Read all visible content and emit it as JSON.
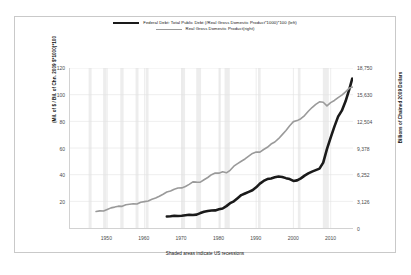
{
  "chart_data": {
    "type": "line",
    "title": "",
    "xlabel": "",
    "ylabel": "(Mil. of $ / Bil. of Chn. 2009 $*1000)*100",
    "y2label": "Billions of Chained 2009 Dollars",
    "footnote": "Shaded areas indicate US recessions",
    "grid": true,
    "legend_position": "top-center",
    "xlim": [
      1940,
      2016
    ],
    "ylim": [
      0,
      120
    ],
    "y2lim": [
      0,
      18756
    ],
    "xticks": [
      1950,
      1960,
      1970,
      1980,
      1990,
      2000,
      2010
    ],
    "xticklabels": [
      "1950",
      "1960",
      "1970",
      "1980",
      "1990",
      "2000",
      "2010"
    ],
    "yticks": [
      20,
      40,
      60,
      80,
      100,
      120
    ],
    "yticklabels": [
      "20",
      "40",
      "60",
      "80",
      "100",
      "120"
    ],
    "y2ticks": [
      0,
      3126,
      6252,
      9378,
      12504,
      15630,
      18750
    ],
    "y2ticklabels": [
      "0",
      "3,126",
      "6,252",
      "9,378",
      "12,504",
      "15,630",
      "18,750"
    ],
    "recession_bands": [
      [
        1945.0,
        1945.8
      ],
      [
        1948.9,
        1949.8
      ],
      [
        1953.5,
        1954.4
      ],
      [
        1957.6,
        1958.4
      ],
      [
        1960.3,
        1961.1
      ],
      [
        1969.9,
        1970.9
      ],
      [
        1973.9,
        1975.2
      ],
      [
        1980.0,
        1980.5
      ],
      [
        1981.5,
        1982.9
      ],
      [
        1990.5,
        1991.2
      ],
      [
        2001.2,
        2001.9
      ],
      [
        2007.9,
        2009.5
      ]
    ],
    "series": [
      {
        "name": "Federal Debt: Total Public Debt (/Real Gross Domestic Product*1000)*100 (left)",
        "axis": "left",
        "color": "#1a1a1a",
        "width": 2.6,
        "points": [
          [
            1966.0,
            8.6
          ],
          [
            1967.0,
            8.8
          ],
          [
            1968.0,
            9.2
          ],
          [
            1969.0,
            9.0
          ],
          [
            1970.0,
            9.2
          ],
          [
            1971.0,
            9.6
          ],
          [
            1972.0,
            9.9
          ],
          [
            1973.0,
            9.8
          ],
          [
            1974.0,
            10.0
          ],
          [
            1975.0,
            11.2
          ],
          [
            1976.0,
            12.2
          ],
          [
            1977.0,
            12.8
          ],
          [
            1978.0,
            13.1
          ],
          [
            1979.0,
            13.2
          ],
          [
            1980.0,
            14.0
          ],
          [
            1981.0,
            14.6
          ],
          [
            1982.0,
            16.4
          ],
          [
            1983.0,
            18.6
          ],
          [
            1984.0,
            20.0
          ],
          [
            1985.0,
            22.3
          ],
          [
            1986.0,
            24.7
          ],
          [
            1987.0,
            25.9
          ],
          [
            1988.0,
            27.1
          ],
          [
            1989.0,
            28.3
          ],
          [
            1990.0,
            30.5
          ],
          [
            1991.0,
            33.3
          ],
          [
            1992.0,
            35.3
          ],
          [
            1993.0,
            36.7
          ],
          [
            1994.0,
            37.2
          ],
          [
            1995.0,
            38.0
          ],
          [
            1996.0,
            38.6
          ],
          [
            1997.0,
            38.2
          ],
          [
            1998.0,
            37.4
          ],
          [
            1999.0,
            36.7
          ],
          [
            2000.0,
            35.3
          ],
          [
            2001.0,
            35.7
          ],
          [
            2002.0,
            37.2
          ],
          [
            2003.0,
            39.3
          ],
          [
            2004.0,
            41.0
          ],
          [
            2005.0,
            42.3
          ],
          [
            2006.0,
            43.4
          ],
          [
            2007.0,
            44.5
          ],
          [
            2008.0,
            49.0
          ],
          [
            2009.0,
            59.2
          ],
          [
            2010.0,
            67.8
          ],
          [
            2011.0,
            76.0
          ],
          [
            2012.0,
            83.5
          ],
          [
            2013.0,
            88.0
          ],
          [
            2014.0,
            95.0
          ],
          [
            2015.0,
            104.0
          ],
          [
            2015.8,
            112.0
          ],
          [
            2016.2,
            111.0
          ]
        ]
      },
      {
        "name": "Real Gross Domestic Product(right)",
        "axis": "right",
        "color": "#9a9a9a",
        "width": 1.6,
        "points": [
          [
            1947.0,
            1930
          ],
          [
            1948.0,
            2010
          ],
          [
            1949.0,
            1990
          ],
          [
            1950.0,
            2180
          ],
          [
            1951.0,
            2360
          ],
          [
            1952.0,
            2450
          ],
          [
            1953.0,
            2560
          ],
          [
            1954.0,
            2540
          ],
          [
            1955.0,
            2720
          ],
          [
            1956.0,
            2780
          ],
          [
            1957.0,
            2840
          ],
          [
            1958.0,
            2810
          ],
          [
            1959.0,
            3010
          ],
          [
            1960.0,
            3090
          ],
          [
            1961.0,
            3170
          ],
          [
            1962.0,
            3360
          ],
          [
            1963.0,
            3510
          ],
          [
            1964.0,
            3720
          ],
          [
            1965.0,
            3960
          ],
          [
            1966.0,
            4220
          ],
          [
            1967.0,
            4340
          ],
          [
            1968.0,
            4550
          ],
          [
            1969.0,
            4690
          ],
          [
            1970.0,
            4700
          ],
          [
            1971.0,
            4860
          ],
          [
            1972.0,
            5120
          ],
          [
            1973.0,
            5410
          ],
          [
            1974.0,
            5380
          ],
          [
            1975.0,
            5370
          ],
          [
            1976.0,
            5660
          ],
          [
            1977.0,
            5920
          ],
          [
            1978.0,
            6250
          ],
          [
            1979.0,
            6450
          ],
          [
            1980.0,
            6430
          ],
          [
            1981.0,
            6590
          ],
          [
            1982.0,
            6470
          ],
          [
            1983.0,
            6760
          ],
          [
            1984.0,
            7250
          ],
          [
            1985.0,
            7550
          ],
          [
            1986.0,
            7830
          ],
          [
            1987.0,
            8090
          ],
          [
            1988.0,
            8430
          ],
          [
            1989.0,
            8740
          ],
          [
            1990.0,
            8910
          ],
          [
            1991.0,
            8890
          ],
          [
            1992.0,
            9200
          ],
          [
            1993.0,
            9460
          ],
          [
            1994.0,
            9840
          ],
          [
            1995.0,
            10080
          ],
          [
            1996.0,
            10470
          ],
          [
            1997.0,
            10950
          ],
          [
            1998.0,
            11440
          ],
          [
            1999.0,
            11990
          ],
          [
            2000.0,
            12470
          ],
          [
            2001.0,
            12590
          ],
          [
            2002.0,
            12810
          ],
          [
            2003.0,
            13180
          ],
          [
            2004.0,
            13680
          ],
          [
            2005.0,
            14120
          ],
          [
            2006.0,
            14500
          ],
          [
            2007.0,
            14790
          ],
          [
            2008.0,
            14740
          ],
          [
            2009.0,
            14320
          ],
          [
            2010.0,
            14700
          ],
          [
            2011.0,
            14950
          ],
          [
            2012.0,
            15290
          ],
          [
            2013.0,
            15570
          ],
          [
            2014.0,
            15960
          ],
          [
            2015.0,
            16400
          ],
          [
            2016.2,
            16550
          ]
        ]
      }
    ]
  },
  "legend": {
    "items": [
      {
        "label": "Federal Debt: Total Public Debt (/Real Gross Domestic Product*1000)*100 (left)",
        "style": "debt"
      },
      {
        "label": "Real Gross Domestic Product(right)",
        "style": "gdp"
      }
    ]
  }
}
